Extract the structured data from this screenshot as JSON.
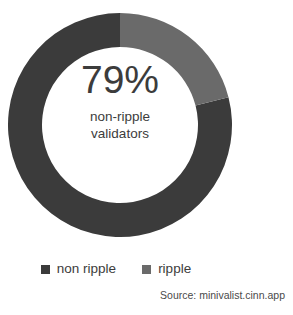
{
  "chart_data": {
    "type": "pie",
    "variant": "donut",
    "title": "",
    "subtitle": "",
    "xlabel": "",
    "ylabel": "",
    "grid": false,
    "legend_position": "bottom",
    "start_angle_deg": 0,
    "direction": "clockwise",
    "categories": [
      "non ripple",
      "ripple"
    ],
    "values": [
      79,
      21
    ],
    "unit": "%",
    "slices": [
      {
        "label": "non ripple",
        "value": 79,
        "color": "#3b3b3b"
      },
      {
        "label": "ripple",
        "value": 21,
        "color": "#6a6a6a"
      }
    ],
    "center_annotation": {
      "value": "79%",
      "line1": "non-ripple",
      "line2": "validators"
    },
    "legend": [
      {
        "label": "non ripple",
        "color": "#3b3b3b"
      },
      {
        "label": "ripple",
        "color": "#6a6a6a"
      }
    ],
    "source": "Source: minivalist.cinn.app"
  },
  "colors": {
    "non_ripple": "#3b3b3b",
    "ripple": "#6a6a6a",
    "text": "#3c3c3c",
    "source_text": "#4a4a4a",
    "background": "#ffffff"
  }
}
